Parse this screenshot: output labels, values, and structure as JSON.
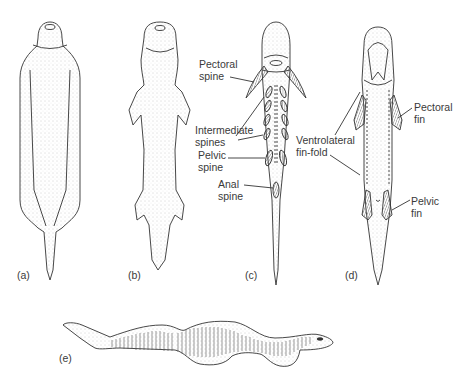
{
  "figure": {
    "panels": [
      {
        "id": "a",
        "label": "(a)"
      },
      {
        "id": "b",
        "label": "(b)"
      },
      {
        "id": "c",
        "label": "(c)"
      },
      {
        "id": "d",
        "label": "(d)"
      },
      {
        "id": "e",
        "label": "(e)"
      }
    ],
    "annotations_c": {
      "pectoral_spine": [
        "Pectoral",
        "spine"
      ],
      "intermediate_spines": [
        "Intermediate",
        "spines"
      ],
      "pelvic_spine": [
        "Pelvic",
        "spine"
      ],
      "anal_spine": [
        "Anal",
        "spine"
      ]
    },
    "annotations_d": {
      "ventrolateral_fin_fold": [
        "Ventrolateral",
        "fin-fold"
      ],
      "pectoral_fin": [
        "Pectoral",
        "fin"
      ],
      "pelvic_fin": [
        "Pelvic",
        "fin"
      ]
    }
  },
  "colors": {
    "line": "#333333",
    "stipple": "#bdbdbd",
    "text": "#3a3a3a",
    "background": "#ffffff"
  }
}
